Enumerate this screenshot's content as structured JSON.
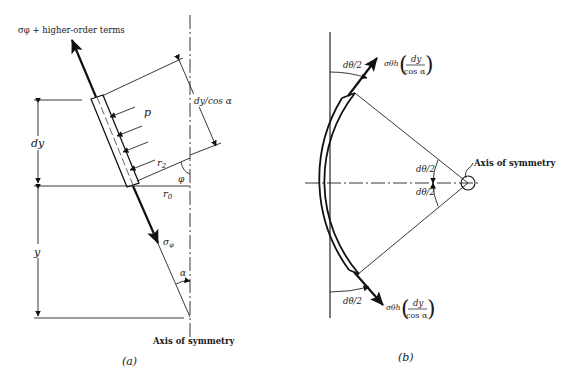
{
  "figure_a": {
    "caption": "(a)",
    "top_force_label": "σφ + higher-order terms",
    "pressure_label": "p",
    "dy_label": "dy",
    "dy_cos_label": "dy/cos α",
    "r2_label": "r",
    "r2_sub": "2",
    "r0_label": "r",
    "r0_sub": "0",
    "phi_label": "φ",
    "sigma_label": "σ",
    "sigma_sub": "φ",
    "y_label": "y",
    "alpha_label": "α",
    "axis_label": "Axis of symmetry"
  },
  "figure_b": {
    "caption": "(b)",
    "top_angle_label": "dθ/2",
    "bottom_angle_label": "dθ/2",
    "center_upper_label": "dθ/2",
    "center_lower_label": "dθ/2",
    "force_prefix": "σθh",
    "force_numerator": "dy",
    "force_denominator": "cos α",
    "axis_label": "Axis of symmetry"
  }
}
